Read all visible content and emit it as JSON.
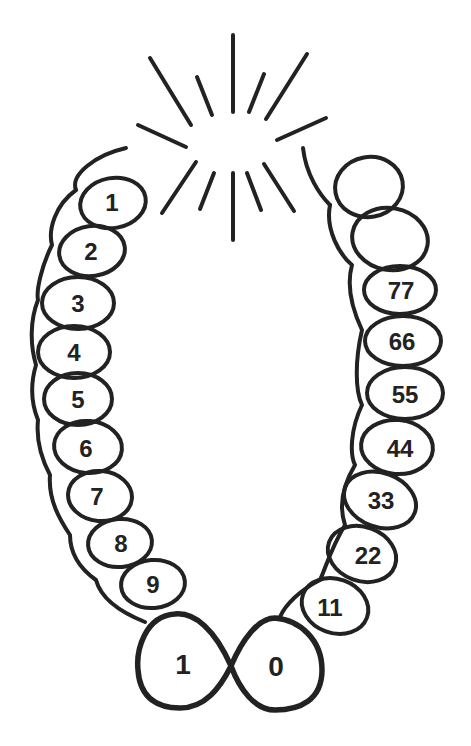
{
  "diagram": {
    "colors": {
      "ink": "#222222",
      "background": "#ffffff"
    },
    "left_chain": {
      "labels": [
        "1",
        "2",
        "3",
        "4",
        "5",
        "6",
        "7",
        "8",
        "9"
      ]
    },
    "bottom_pair": {
      "left_label": "1",
      "right_label": "0"
    },
    "right_chain": {
      "labels": [
        "11",
        "22",
        "33",
        "44",
        "55",
        "66",
        "77"
      ],
      "unlabeled_loops_at_top": 2
    },
    "burst": {
      "ray_count": 12
    }
  }
}
